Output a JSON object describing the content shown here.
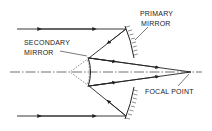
{
  "diagram": {
    "labels": {
      "primary_line1": "PRIMARY",
      "primary_line2": "MIRROR",
      "secondary_line1": "SECONDARY",
      "secondary_line2": "MIRROR",
      "focal": "FOCAL POINT"
    },
    "colors": {
      "stroke": "#222222",
      "background": "#ffffff"
    }
  }
}
